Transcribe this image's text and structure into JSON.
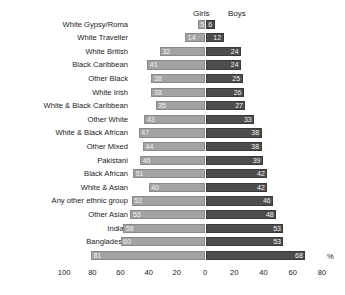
{
  "header": {
    "girls_label": "Girls",
    "boys_label": "Boys",
    "percent_label": "%"
  },
  "colors": {
    "girls_bar": "#a3a3a3",
    "boys_bar": "#4d4d4d",
    "background": "#ffffff",
    "text": "#1a1a1a",
    "bar_value_text": "#f2f2f2"
  },
  "chart_data": {
    "type": "bar",
    "title": "",
    "subtitle": "",
    "orientation": "horizontal-diverging",
    "xlabel": "%",
    "ylabel": "",
    "grid": false,
    "legend_position": "top-center",
    "axis": {
      "left_max": 100,
      "right_max": 80,
      "tick_step": 20,
      "tick_labels": [
        "100",
        "80",
        "60",
        "40",
        "20",
        "0",
        "20",
        "40",
        "60",
        "80"
      ],
      "tick_values": [
        -100,
        -80,
        -60,
        -40,
        -20,
        0,
        20,
        40,
        60,
        80
      ]
    },
    "categories": [
      "White Gypsy/Roma",
      "White Traveller",
      "White British",
      "Black Caribbean",
      "Other Black",
      "White Irish",
      "White & Black Caribbean",
      "Other White",
      "White & Black African",
      "Other Mixed",
      "Pakistani",
      "Black African",
      "White & Asian",
      "Any other ethnic group",
      "Other Asian",
      "Indian",
      "Bangladeshi",
      "Chinese"
    ],
    "series": [
      {
        "name": "Girls",
        "side": "left",
        "color": "#a3a3a3",
        "values": [
          5,
          14,
          32,
          41,
          38,
          38,
          35,
          43,
          47,
          44,
          46,
          51,
          40,
          52,
          53,
          58,
          60,
          81
        ]
      },
      {
        "name": "Boys",
        "side": "right",
        "color": "#4d4d4d",
        "values": [
          6,
          12,
          24,
          24,
          25,
          26,
          27,
          33,
          38,
          38,
          39,
          42,
          42,
          46,
          48,
          53,
          53,
          68
        ]
      }
    ]
  }
}
